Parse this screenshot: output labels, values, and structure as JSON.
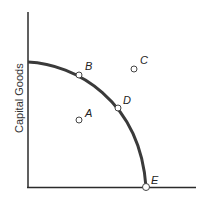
{
  "diagram": {
    "y_axis_label": "Capital Goods",
    "x_axis_label": "",
    "points": [
      {
        "label": "A",
        "x": 79,
        "y": 120,
        "lx": 85,
        "ly": 117
      },
      {
        "label": "B",
        "x": 79,
        "y": 75,
        "lx": 85,
        "ly": 70
      },
      {
        "label": "C",
        "x": 134,
        "y": 69,
        "lx": 140,
        "ly": 64
      },
      {
        "label": "D",
        "x": 118,
        "y": 108,
        "lx": 123,
        "ly": 104
      },
      {
        "label": "E",
        "x": 146,
        "y": 187,
        "lx": 151,
        "ly": 184
      }
    ],
    "colors": {
      "axis": "#2b2b2b",
      "curve": "#3a3a3a",
      "point_fill": "#ffffff"
    }
  }
}
